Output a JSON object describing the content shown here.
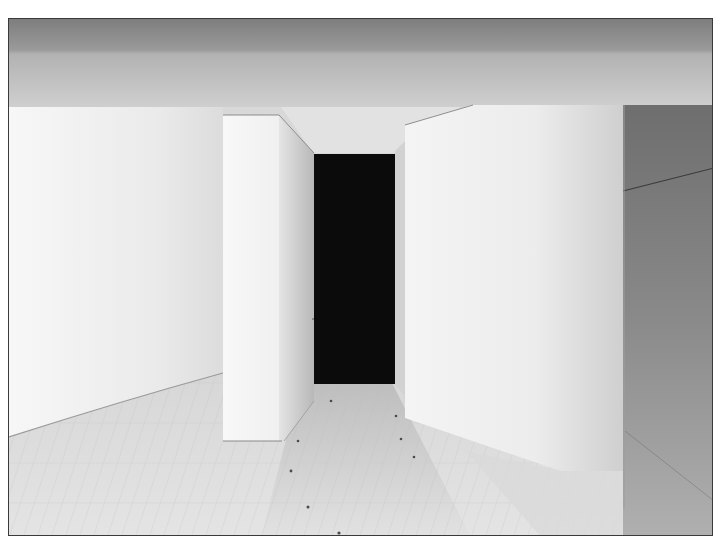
{
  "image": {
    "description": "Black-and-white photograph of a minimalist gallery interior with white wall panels, a dark doorway, and a pale wooden plank floor",
    "palette": {
      "ceiling_dark": "#8a8a8a",
      "ceiling_light": "#c4c4c4",
      "wall_white": "#f4f4f4",
      "wall_shade": "#d6d6d6",
      "doorway": "#0c0c0c",
      "floor_light": "#e6e6e6",
      "floor_shadow": "#bdbdbd",
      "right_wall_dark": "#7d7d7d",
      "frame_border": "#3a3a3a"
    }
  }
}
